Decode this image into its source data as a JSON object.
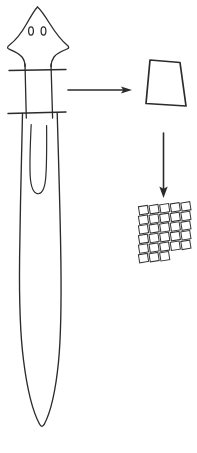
{
  "figure": {
    "background_color": "#ffffff",
    "ink_color": "#2b2b2b",
    "canvas": {
      "width": 197,
      "height": 453
    }
  },
  "artifact": {
    "name": "dagger",
    "label": "",
    "parts": [
      {
        "name": "pommel",
        "label": "",
        "rivet_count": 2
      },
      {
        "name": "grip",
        "label": "",
        "crossbar_count": 2
      },
      {
        "name": "blade",
        "label": "",
        "has_fuller": true
      }
    ],
    "outline_color": "#2b2b2b",
    "line_width": 1.2
  },
  "rivets": [
    {
      "cx": 31,
      "cy": 31,
      "rx": 2.4,
      "ry": 4.0
    },
    {
      "cx": 44,
      "cy": 31,
      "rx": 2.4,
      "ry": 4.0
    }
  ],
  "arrows": [
    {
      "name": "arrow-to-sample",
      "direction": "right",
      "label": "",
      "x1": 66,
      "y1": 90,
      "x2": 128,
      "y2": 90
    },
    {
      "name": "arrow-to-microstructure",
      "direction": "down",
      "label": "",
      "x1": 163,
      "y1": 135,
      "x2": 163,
      "y2": 196
    }
  ],
  "sample": {
    "name": "sample-section",
    "label": "",
    "shape": "trapezoid",
    "points": "150,60 180,62 186,106 146,104"
  },
  "microstructure": {
    "name": "cell-grid",
    "label": "",
    "columns": 5,
    "rows": 6,
    "origin_x": 139,
    "origin_y": 206,
    "cell_width": 9,
    "cell_height": 8.2,
    "gap_x": 1.6,
    "gap_y": 1.4,
    "skew_deg": -9,
    "cell_fill": "#ffffff",
    "cell_stroke": "#343434",
    "cells": [
      [
        1,
        1,
        1,
        1,
        1
      ],
      [
        1,
        1,
        1,
        1,
        1
      ],
      [
        1,
        1,
        1,
        1,
        1
      ],
      [
        1,
        1,
        1,
        1,
        1
      ],
      [
        1,
        1,
        1,
        1,
        1
      ],
      [
        1,
        1,
        1,
        0,
        0
      ]
    ]
  },
  "labels": {
    "figure_caption": "",
    "scale_bar": "",
    "annotations": []
  }
}
